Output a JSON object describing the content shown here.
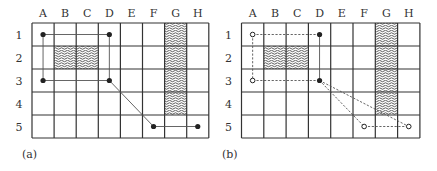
{
  "figure": {
    "columns": [
      "A",
      "B",
      "C",
      "D",
      "E",
      "F",
      "G",
      "H"
    ],
    "rows": [
      "1",
      "2",
      "3",
      "4",
      "5"
    ],
    "obstacles": [
      {
        "col": "B",
        "row": "2"
      },
      {
        "col": "C",
        "row": "2"
      },
      {
        "col": "G",
        "row": "1"
      },
      {
        "col": "G",
        "row": "2"
      },
      {
        "col": "G",
        "row": "3"
      },
      {
        "col": "G",
        "row": "4"
      }
    ],
    "panels": [
      {
        "caption": "(a)",
        "nodes": [
          {
            "col": "A",
            "row": "1",
            "style": "filled"
          },
          {
            "col": "D",
            "row": "1",
            "style": "filled"
          },
          {
            "col": "A",
            "row": "3",
            "style": "filled"
          },
          {
            "col": "D",
            "row": "3",
            "style": "filled"
          },
          {
            "col": "F",
            "row": "5",
            "style": "filled"
          },
          {
            "col": "H",
            "row": "5",
            "style": "filled"
          }
        ],
        "edges": [
          {
            "from": [
              "A",
              "1"
            ],
            "to": [
              "D",
              "1"
            ],
            "style": "solid"
          },
          {
            "from": [
              "A",
              "1"
            ],
            "to": [
              "A",
              "3"
            ],
            "style": "solid"
          },
          {
            "from": [
              "A",
              "3"
            ],
            "to": [
              "D",
              "3"
            ],
            "style": "solid"
          },
          {
            "from": [
              "D",
              "1"
            ],
            "to": [
              "D",
              "3"
            ],
            "style": "solid"
          },
          {
            "from": [
              "D",
              "3"
            ],
            "to": [
              "F",
              "5"
            ],
            "style": "solid"
          },
          {
            "from": [
              "F",
              "5"
            ],
            "to": [
              "H",
              "5"
            ],
            "style": "solid"
          }
        ]
      },
      {
        "caption": "(b)",
        "nodes": [
          {
            "col": "A",
            "row": "1",
            "style": "open"
          },
          {
            "col": "D",
            "row": "1",
            "style": "filled"
          },
          {
            "col": "A",
            "row": "3",
            "style": "open"
          },
          {
            "col": "D",
            "row": "3",
            "style": "filled"
          },
          {
            "col": "F",
            "row": "5",
            "style": "open"
          },
          {
            "col": "H",
            "row": "5",
            "style": "open"
          }
        ],
        "edges": [
          {
            "from": [
              "A",
              "1"
            ],
            "to": [
              "D",
              "1"
            ],
            "style": "dashed"
          },
          {
            "from": [
              "A",
              "1"
            ],
            "to": [
              "A",
              "3"
            ],
            "style": "dashed"
          },
          {
            "from": [
              "A",
              "3"
            ],
            "to": [
              "D",
              "3"
            ],
            "style": "dashed"
          },
          {
            "from": [
              "D",
              "1"
            ],
            "to": [
              "D",
              "3"
            ],
            "style": "solid"
          },
          {
            "from": [
              "D",
              "3"
            ],
            "to": [
              "F",
              "5"
            ],
            "style": "dashed"
          },
          {
            "from": [
              "D",
              "3"
            ],
            "to": [
              "H",
              "5"
            ],
            "style": "dashed"
          },
          {
            "from": [
              "F",
              "5"
            ],
            "to": [
              "H",
              "5"
            ],
            "style": "dashed"
          }
        ]
      }
    ]
  },
  "colors": {
    "grid": "#333333",
    "edge": "#555555",
    "node": "#222222",
    "hatch": "#333333"
  }
}
